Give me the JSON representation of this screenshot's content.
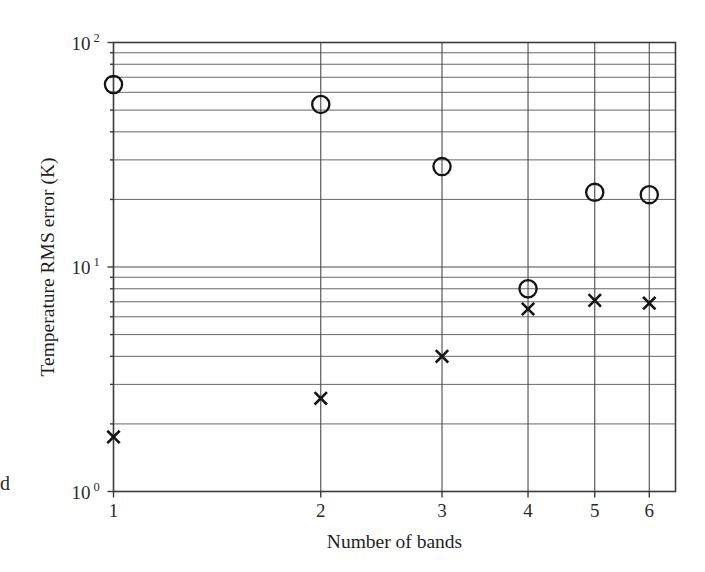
{
  "chart_data": {
    "type": "scatter",
    "title": "",
    "xlabel": "Number of bands",
    "ylabel": "Temperature RMS error (K)",
    "xscale": "log",
    "yscale": "log",
    "xlim": [
      1,
      6.55
    ],
    "ylim": [
      1,
      100
    ],
    "grid": true,
    "legend": "none",
    "x_tick_labels": [
      "1",
      "2",
      "3",
      "4",
      "5",
      "6"
    ],
    "x_ticks": [
      1,
      2,
      3,
      4,
      5,
      6
    ],
    "y_tick_labels": [
      "10",
      "10",
      "10"
    ],
    "y_tick_exponents": [
      "0",
      "1",
      "2"
    ],
    "y_ticks": [
      1,
      10,
      100
    ],
    "series": [
      {
        "name": "circle-series",
        "marker": "circle-open",
        "x": [
          1,
          2,
          3,
          4,
          5,
          6
        ],
        "values": [
          65,
          53,
          28,
          8.0,
          21.5,
          21
        ]
      },
      {
        "name": "cross-series",
        "marker": "x-cross",
        "x": [
          1,
          2,
          3,
          4,
          5,
          6
        ],
        "values": [
          1.75,
          2.6,
          4.0,
          6.5,
          7.1,
          6.9
        ]
      }
    ]
  },
  "figure": {
    "ylabel": "Temperature RMS error (K)",
    "xlabel": "Number of bands",
    "y_axis_labels": [
      {
        "mantissa": "10",
        "exponent": "0",
        "value": 1
      },
      {
        "mantissa": "10",
        "exponent": "1",
        "value": 10
      },
      {
        "mantissa": "10",
        "exponent": "2",
        "value": 100
      }
    ],
    "x_axis_labels": [
      {
        "label": "1",
        "value": 1
      },
      {
        "label": "2",
        "value": 2
      },
      {
        "label": "3",
        "value": 3
      },
      {
        "label": "4",
        "value": 4
      },
      {
        "label": "5",
        "value": 5
      },
      {
        "label": "6",
        "value": 6
      }
    ],
    "page_edge_fragment": "d"
  }
}
